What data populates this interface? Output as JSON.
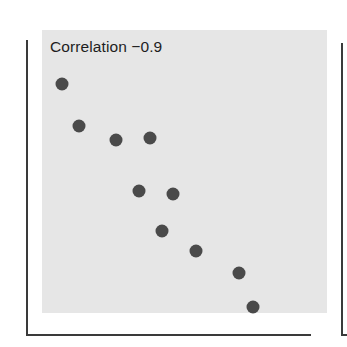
{
  "chart_data": {
    "type": "scatter",
    "title": "",
    "annotation": "Correlation  −0.9",
    "xlabel": "",
    "ylabel": "",
    "xlim": [
      0,
      10
    ],
    "ylim": [
      0,
      10
    ],
    "grid": false,
    "legend": null,
    "tick_labels": false,
    "series": [
      {
        "name": "points",
        "color": "#4a4a4a",
        "x": [
          0.7,
          1.3,
          2.6,
          3.8,
          3.4,
          4.6,
          4.2,
          5.4,
          6.9,
          7.4
        ],
        "y": [
          8.1,
          6.6,
          6.1,
          6.2,
          4.3,
          4.2,
          2.9,
          2.2,
          1.4,
          0.2
        ]
      }
    ]
  },
  "plot": {
    "annotation_text": "Correlation  −0.9",
    "panel_color": "#e6e6e6",
    "axis_color": "#3a3a3a",
    "point_color": "#4a4a4a"
  }
}
